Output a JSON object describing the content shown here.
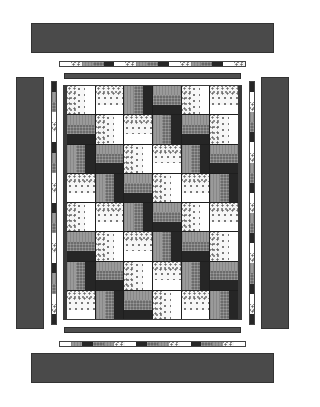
{
  "quilt": {
    "colors": {
      "border": "#4a4a4a",
      "inner_bar": "#4e4e4e",
      "frame": "#3a3a3a",
      "sashing_line": "#1e1e1e"
    },
    "fabrics": {
      "light": [
        "floral",
        "dot",
        "white"
      ],
      "dark": [
        "gray",
        "grid",
        "black"
      ]
    },
    "grid": {
      "columns": 6,
      "rows": 8,
      "blocks": [
        [
          "L-V",
          "L-H",
          "D-V",
          "D-H",
          "L-V",
          "L-H"
        ],
        [
          "D-H",
          "L-V",
          "L-H",
          "D-V",
          "D-H",
          "L-V"
        ],
        [
          "D-V",
          "D-H",
          "L-V",
          "L-H",
          "D-V",
          "D-H"
        ],
        [
          "L-H",
          "D-V",
          "D-H",
          "L-V",
          "L-H",
          "D-V"
        ],
        [
          "L-V",
          "L-H",
          "D-V",
          "D-H",
          "L-V",
          "L-H"
        ],
        [
          "D-H",
          "L-V",
          "L-H",
          "D-V",
          "D-H",
          "L-V"
        ],
        [
          "D-V",
          "D-H",
          "L-V",
          "L-H",
          "D-V",
          "D-H"
        ],
        [
          "L-H",
          "D-V",
          "D-H",
          "L-V",
          "L-H",
          "D-V"
        ]
      ]
    },
    "pieced_strips": {
      "top": [
        "white",
        "floral",
        "gray",
        "grid",
        "black",
        "white",
        "floral",
        "gray",
        "grid",
        "black",
        "white",
        "floral",
        "gray",
        "grid",
        "black",
        "white",
        "floral"
      ],
      "bottom": [
        "white",
        "gray",
        "black",
        "grid",
        "gray",
        "floral",
        "white",
        "black",
        "grid",
        "gray",
        "floral",
        "white",
        "black",
        "grid",
        "gray",
        "floral",
        "white"
      ],
      "left": [
        "black",
        "gray",
        "grid",
        "white",
        "floral",
        "white",
        "black",
        "gray",
        "grid",
        "white",
        "floral",
        "white",
        "black",
        "gray",
        "grid",
        "white",
        "floral",
        "white",
        "black",
        "gray",
        "grid",
        "white",
        "floral",
        "black"
      ],
      "right": [
        "black",
        "white",
        "floral",
        "gray",
        "grid",
        "black",
        "white",
        "floral",
        "gray",
        "grid",
        "black",
        "white",
        "floral",
        "gray",
        "grid",
        "black",
        "white",
        "floral",
        "gray",
        "grid",
        "black",
        "white",
        "floral",
        "black"
      ]
    }
  }
}
